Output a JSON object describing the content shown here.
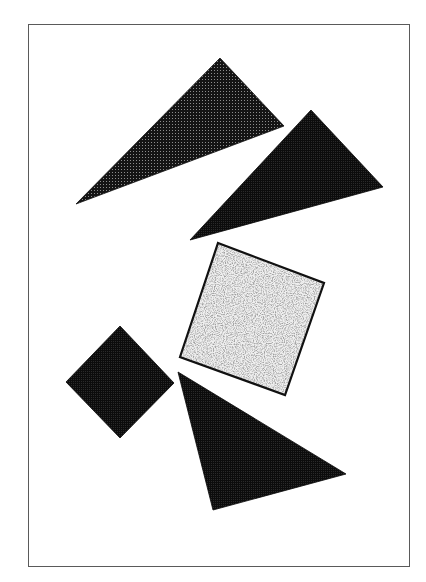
{
  "figure": {
    "frame": {
      "x": 28,
      "y": 24,
      "width": 382,
      "height": 543,
      "border_color": "#5a5a5a"
    },
    "colors": {
      "dark_fill": "#111111",
      "darker_fill": "#0a0a0a",
      "dot_color": "#9a9a9a",
      "speckle_bg": "#ededed",
      "speckle_dot": "#6e6e6e",
      "outline": "#111111"
    },
    "shapes": [
      {
        "id": "triangle-top-left",
        "type": "triangle",
        "fill": "dotted-dark",
        "points": [
          [
            76,
            204
          ],
          [
            220,
            58
          ],
          [
            284,
            126
          ]
        ]
      },
      {
        "id": "triangle-top-right",
        "type": "triangle",
        "fill": "dense-dark",
        "points": [
          [
            190,
            240
          ],
          [
            311,
            110
          ],
          [
            383,
            187
          ]
        ]
      },
      {
        "id": "square-speckled",
        "type": "square",
        "fill": "speckled-light",
        "outlined": true,
        "points": [
          [
            218,
            243
          ],
          [
            324,
            283
          ],
          [
            285,
            395
          ],
          [
            180,
            357
          ]
        ]
      },
      {
        "id": "diamond-left",
        "type": "square",
        "fill": "dense-dark",
        "points": [
          [
            120,
            326
          ],
          [
            174,
            383
          ],
          [
            120,
            438
          ],
          [
            66,
            382
          ]
        ]
      },
      {
        "id": "triangle-bottom",
        "type": "triangle",
        "fill": "dense-dark",
        "points": [
          [
            178,
            372
          ],
          [
            346,
            474
          ],
          [
            213,
            510
          ]
        ]
      }
    ]
  }
}
